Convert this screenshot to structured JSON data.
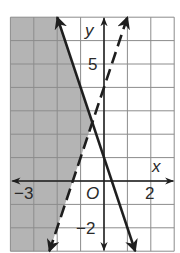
{
  "chart_data": {
    "type": "line",
    "title": "",
    "xlabel": "x",
    "ylabel": "y",
    "xlim": [
      -4,
      3
    ],
    "ylim": [
      -3,
      7
    ],
    "grid": true,
    "tick_labels": {
      "x": [
        {
          "value": -3,
          "label": "−3"
        },
        {
          "value": 2,
          "label": "2"
        }
      ],
      "y": [
        {
          "value": 5,
          "label": "5"
        },
        {
          "value": -2,
          "label": "−2"
        }
      ],
      "origin": "O"
    },
    "series": [
      {
        "name": "boundary-solid",
        "equation": "y = -3x + 1",
        "slope": -3,
        "intercept": 1,
        "style": "solid",
        "points": [
          [
            -2,
            7
          ],
          [
            1.333,
            -3
          ]
        ]
      },
      {
        "name": "boundary-dashed",
        "equation": "y = 3x + 4",
        "slope": 3,
        "intercept": 4,
        "style": "dashed",
        "points": [
          [
            -2.333,
            -3
          ],
          [
            1,
            7
          ]
        ]
      }
    ],
    "intersection": [
      -0.5,
      2.5
    ],
    "shaded_region": "y <= -3x + 1 and y > 3x + 4 (left of both lines)",
    "colors": {
      "shade": "#b4b4b4",
      "grid": "#8c8c8c",
      "line": "#1e1e1e",
      "background": "#ffffff"
    }
  },
  "labels": {
    "x_axis": "x",
    "y_axis": "y",
    "origin": "O",
    "x_neg3": "−3",
    "x_2": "2",
    "y_5": "5",
    "y_neg2": "−2"
  }
}
